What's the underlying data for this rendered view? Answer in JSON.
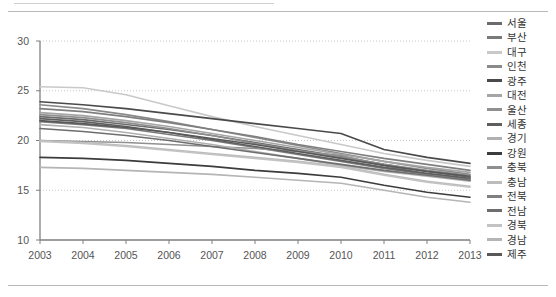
{
  "chart_data": {
    "type": "line",
    "title": "",
    "subtitle": "",
    "xlabel": "",
    "ylabel": "",
    "x": [
      2003,
      2004,
      2005,
      2006,
      2007,
      2008,
      2009,
      2010,
      2011,
      2012,
      2013
    ],
    "xticklabels": [
      "2003",
      "2004",
      "2005",
      "2006",
      "2007",
      "2008",
      "2009",
      "2010",
      "2011",
      "2012",
      "2013"
    ],
    "yticklabels": [
      "10",
      "15",
      "20",
      "25",
      "30"
    ],
    "yticks": [
      10,
      15,
      20,
      25,
      30
    ],
    "ylim": [
      10,
      30
    ],
    "xlim": [
      2003,
      2013
    ],
    "grid": true,
    "grid_style": "dotted-horizontal",
    "legend_position": "right",
    "series": [
      {
        "name": "서울",
        "color": "#6b6b6b",
        "values": [
          22.4,
          22.1,
          21.6,
          21.1,
          20.5,
          19.8,
          19.1,
          18.4,
          17.6,
          16.9,
          16.3
        ]
      },
      {
        "name": "부산",
        "color": "#7a7a7a",
        "values": [
          21.9,
          21.6,
          21.2,
          20.6,
          20.0,
          19.3,
          18.6,
          17.9,
          17.2,
          16.6,
          16.1
        ]
      },
      {
        "name": "대구",
        "color": "#c9c9c9",
        "values": [
          25.4,
          25.3,
          24.6,
          23.5,
          22.4,
          21.4,
          20.5,
          19.6,
          18.7,
          18.0,
          17.4
        ]
      },
      {
        "name": "인천",
        "color": "#8a8a8a",
        "values": [
          23.6,
          23.2,
          22.6,
          21.9,
          21.1,
          20.3,
          19.5,
          18.7,
          17.9,
          17.2,
          16.6
        ]
      },
      {
        "name": "광주",
        "color": "#4a4a4a",
        "values": [
          23.9,
          23.6,
          23.2,
          22.7,
          22.2,
          21.7,
          21.2,
          20.7,
          19.1,
          18.3,
          17.7
        ]
      },
      {
        "name": "대전",
        "color": "#a5a5a5",
        "values": [
          22.8,
          22.5,
          22.0,
          21.4,
          20.7,
          20.0,
          19.3,
          18.6,
          17.9,
          17.3,
          16.8
        ]
      },
      {
        "name": "울산",
        "color": "#909090",
        "values": [
          20.0,
          19.9,
          19.8,
          19.6,
          19.4,
          19.2,
          18.9,
          18.5,
          17.5,
          16.6,
          16.0
        ]
      },
      {
        "name": "세종",
        "color": "#5e5e5e",
        "values": [
          22.2,
          21.9,
          21.4,
          20.8,
          20.1,
          19.4,
          18.7,
          18.0,
          17.3,
          16.7,
          16.2
        ]
      },
      {
        "name": "경기",
        "color": "#b0b0b0",
        "values": [
          21.6,
          21.3,
          20.8,
          20.2,
          19.6,
          18.9,
          18.2,
          17.5,
          16.9,
          16.4,
          15.9
        ]
      },
      {
        "name": "강원",
        "color": "#3c3c3c",
        "values": [
          18.3,
          18.2,
          18.0,
          17.7,
          17.4,
          17.0,
          16.7,
          16.3,
          15.5,
          14.8,
          14.3
        ]
      },
      {
        "name": "충북",
        "color": "#8f8f8f",
        "values": [
          22.6,
          22.3,
          21.8,
          21.2,
          20.5,
          19.7,
          19.0,
          18.3,
          17.6,
          17.0,
          16.5
        ]
      },
      {
        "name": "충남",
        "color": "#bcbcbc",
        "values": [
          20.0,
          19.8,
          19.5,
          19.1,
          18.7,
          18.3,
          17.9,
          17.4,
          16.6,
          15.9,
          15.4
        ]
      },
      {
        "name": "전북",
        "color": "#7f7f7f",
        "values": [
          23.2,
          22.9,
          22.4,
          21.8,
          21.1,
          20.4,
          19.6,
          18.9,
          18.2,
          17.6,
          17.0
        ]
      },
      {
        "name": "전남",
        "color": "#6e6e6e",
        "values": [
          21.2,
          20.9,
          20.5,
          20.0,
          19.4,
          18.8,
          18.2,
          17.6,
          17.0,
          16.5,
          16.0
        ]
      },
      {
        "name": "경북",
        "color": "#c3c3c3",
        "values": [
          19.9,
          19.7,
          19.4,
          19.0,
          18.6,
          18.2,
          17.8,
          17.3,
          16.5,
          15.8,
          15.3
        ]
      },
      {
        "name": "경남",
        "color": "#b5b5b5",
        "values": [
          17.3,
          17.2,
          17.0,
          16.8,
          16.6,
          16.3,
          16.0,
          15.7,
          15.0,
          14.3,
          13.8
        ]
      },
      {
        "name": "제주",
        "color": "#585858",
        "values": [
          22.0,
          21.7,
          21.3,
          20.8,
          20.2,
          19.6,
          18.9,
          18.2,
          17.5,
          16.9,
          16.4
        ]
      }
    ]
  },
  "axes": {
    "y_ticks": [
      "30",
      "25",
      "20",
      "15",
      "10"
    ],
    "x_ticks": [
      "2003",
      "2004",
      "2005",
      "2006",
      "2007",
      "2008",
      "2009",
      "2010",
      "2011",
      "2012",
      "2013"
    ]
  },
  "legend": {
    "items": [
      {
        "label": "서울",
        "color": "#6b6b6b"
      },
      {
        "label": "부산",
        "color": "#7a7a7a"
      },
      {
        "label": "대구",
        "color": "#c9c9c9"
      },
      {
        "label": "인천",
        "color": "#8a8a8a"
      },
      {
        "label": "광주",
        "color": "#4a4a4a"
      },
      {
        "label": "대전",
        "color": "#a5a5a5"
      },
      {
        "label": "울산",
        "color": "#909090"
      },
      {
        "label": "세종",
        "color": "#5e5e5e"
      },
      {
        "label": "경기",
        "color": "#b0b0b0"
      },
      {
        "label": "강원",
        "color": "#3c3c3c"
      },
      {
        "label": "충북",
        "color": "#8f8f8f"
      },
      {
        "label": "충남",
        "color": "#bcbcbc"
      },
      {
        "label": "전북",
        "color": "#7f7f7f"
      },
      {
        "label": "전남",
        "color": "#6e6e6e"
      },
      {
        "label": "경북",
        "color": "#c3c3c3"
      },
      {
        "label": "경남",
        "color": "#b5b5b5"
      },
      {
        "label": "제주",
        "color": "#585858"
      }
    ]
  },
  "style": {
    "axis_color": "#808080",
    "grid_color": "#c8c8c8",
    "tick_text_color": "#555555",
    "frame_rule_color": "#b9b9b9",
    "background": "#ffffff"
  }
}
